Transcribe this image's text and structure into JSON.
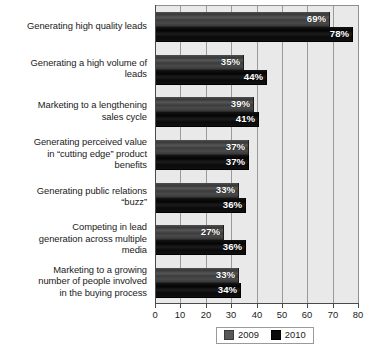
{
  "chart_data": {
    "type": "bar",
    "orientation": "horizontal",
    "title": "",
    "subtitle": "",
    "xlabel": "",
    "ylabel": "",
    "xlim": [
      0,
      80
    ],
    "xticks": [
      0,
      10,
      20,
      30,
      40,
      50,
      60,
      70,
      80
    ],
    "grid": "vertical",
    "legend_position": "bottom-center",
    "value_label_suffix": "%",
    "categories": [
      "Generating high quality leads",
      "Generating a high volume of leads",
      "Marketing to a lengthening sales cycle",
      "Generating perceived value in “cutting edge” product benefits",
      "Generating public relations “buzz”",
      "Competing in lead generation across multiple media",
      "Marketing to a growing number of people involved in the buying process"
    ],
    "category_lines": [
      [
        "Generating high quality leads"
      ],
      [
        "Generating a high volume of",
        "leads"
      ],
      [
        "Marketing to a lengthening",
        "sales cycle"
      ],
      [
        "Generating perceived value",
        "in “cutting edge” product",
        "benefits"
      ],
      [
        "Generating public relations",
        "“buzz”"
      ],
      [
        "Competing in lead",
        "generation across multiple",
        "media"
      ],
      [
        "Marketing to a growing",
        "number of people involved",
        "in the buying process"
      ]
    ],
    "series": [
      {
        "name": "2009",
        "color": "#4a4a4a",
        "values": [
          69,
          35,
          39,
          37,
          33,
          27,
          33
        ],
        "labels": [
          "69%",
          "35%",
          "39%",
          "37%",
          "33%",
          "27%",
          "33%"
        ]
      },
      {
        "name": "2010",
        "color": "#0a0a0a",
        "values": [
          78,
          44,
          41,
          37,
          36,
          36,
          34
        ],
        "labels": [
          "78%",
          "44%",
          "41%",
          "37%",
          "36%",
          "36%",
          "34%"
        ]
      }
    ]
  },
  "legend": {
    "entries": [
      {
        "label": "2009",
        "swatch": "gray-square-swatch"
      },
      {
        "label": "2010",
        "swatch": "black-square-swatch"
      }
    ]
  },
  "axis": {
    "tick_labels": [
      "0",
      "10",
      "20",
      "30",
      "40",
      "50",
      "60",
      "70",
      "80"
    ]
  }
}
